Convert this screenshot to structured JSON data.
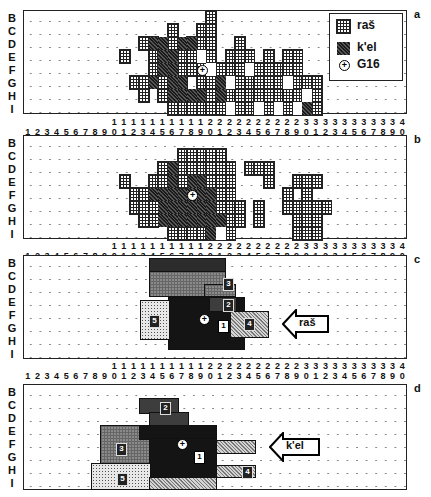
{
  "figure": {
    "row_labels": [
      "B",
      "C",
      "D",
      "E",
      "F",
      "G",
      "H",
      "I"
    ],
    "column_labels": [
      "1",
      "2",
      "3",
      "4",
      "5",
      "6",
      "7",
      "8",
      "9",
      "10",
      "11",
      "12",
      "13",
      "14",
      "15",
      "16",
      "17",
      "18",
      "19",
      "20",
      "21",
      "22",
      "23",
      "24",
      "25",
      "26",
      "27",
      "28",
      "29",
      "30",
      "31",
      "32",
      "33",
      "34",
      "35",
      "36",
      "37",
      "38",
      "39",
      "40"
    ],
    "panels": [
      {
        "letter": "a"
      },
      {
        "letter": "b"
      },
      {
        "letter": "c"
      },
      {
        "letter": "d"
      }
    ]
  },
  "legend": {
    "items": [
      {
        "label": "raš",
        "pattern": "crosshatch"
      },
      {
        "label": "k'el",
        "pattern": "diagonal-dark"
      },
      {
        "label": "G16",
        "symbol": "circled-plus"
      }
    ]
  },
  "panel_c": {
    "arrow_label": "raš",
    "zones": [
      {
        "id": "1"
      },
      {
        "id": "2"
      },
      {
        "id": "3"
      },
      {
        "id": "4"
      },
      {
        "id": "5"
      }
    ]
  },
  "panel_d": {
    "arrow_label": "k'el",
    "zones": [
      {
        "id": "1"
      },
      {
        "id": "2"
      },
      {
        "id": "3"
      },
      {
        "id": "4"
      },
      {
        "id": "5"
      }
    ]
  },
  "chart_data": {
    "type": "heatmap",
    "title": "",
    "xlabel": "Columns 1–40",
    "ylabel": "Rows B–I",
    "x": [
      "1",
      "2",
      "3",
      "4",
      "5",
      "6",
      "7",
      "8",
      "9",
      "10",
      "11",
      "12",
      "13",
      "14",
      "15",
      "16",
      "17",
      "18",
      "19",
      "20",
      "21",
      "22",
      "23",
      "24",
      "25",
      "26",
      "27",
      "28",
      "29",
      "30",
      "31",
      "32",
      "33",
      "34",
      "35",
      "36",
      "37",
      "38",
      "39",
      "40"
    ],
    "y": [
      "B",
      "C",
      "D",
      "E",
      "F",
      "G",
      "H",
      "I"
    ],
    "panels": [
      {
        "letter": "a",
        "legend": [
          "raš",
          "k'el",
          "G16"
        ],
        "ras_runs": [
          [
            "B",
            20,
            20
          ],
          [
            "C",
            19,
            20
          ],
          [
            "C",
            16,
            16
          ],
          [
            "D",
            13,
            14
          ],
          [
            "D",
            16,
            16
          ],
          [
            "D",
            18,
            20
          ],
          [
            "D",
            23,
            23
          ],
          [
            "E",
            11,
            11
          ],
          [
            "E",
            14,
            15
          ],
          [
            "E",
            17,
            18
          ],
          [
            "E",
            19,
            20
          ],
          [
            "E",
            22,
            24
          ],
          [
            "E",
            26,
            26
          ],
          [
            "E",
            28,
            29
          ],
          [
            "F",
            14,
            15
          ],
          [
            "F",
            17,
            17
          ],
          [
            "F",
            18,
            19
          ],
          [
            "F",
            21,
            29
          ],
          [
            "G",
            12,
            13
          ],
          [
            "G",
            15,
            15
          ],
          [
            "G",
            17,
            17
          ],
          [
            "G",
            19,
            20
          ],
          [
            "G",
            21,
            31
          ],
          [
            "H",
            13,
            13
          ],
          [
            "H",
            15,
            16
          ],
          [
            "H",
            20,
            20
          ],
          [
            "H",
            22,
            31
          ],
          [
            "I",
            16,
            31
          ]
        ],
        "kel_runs": [
          [
            "D",
            14,
            15
          ],
          [
            "D",
            17,
            18
          ],
          [
            "E",
            15,
            16
          ],
          [
            "F",
            15,
            16
          ],
          [
            "G",
            14,
            14
          ],
          [
            "G",
            16,
            17
          ],
          [
            "G",
            21,
            21
          ],
          [
            "G",
            28,
            28
          ],
          [
            "H",
            16,
            19
          ],
          [
            "H",
            21,
            21
          ],
          [
            "I",
            30,
            30
          ]
        ],
        "empty_in_ras": [
          [
            "E",
            19,
            19
          ],
          [
            "F",
            20,
            20
          ],
          [
            "F",
            24,
            24
          ],
          [
            "G",
            22,
            22
          ],
          [
            "G",
            28,
            28
          ],
          [
            "H",
            30,
            30
          ],
          [
            "I",
            22,
            22
          ],
          [
            "I",
            25,
            25
          ],
          [
            "I",
            27,
            27
          ],
          [
            "I",
            29,
            29
          ]
        ],
        "g16_cell": [
          "F",
          19
        ]
      },
      {
        "letter": "b",
        "legend": [
          "raš",
          "k'el",
          "G16"
        ],
        "description": "raš crosshatch cluster cols 13–33 rows C–I with k'el core cols 15–21 rows D–I; separate clusters at cols 23–26 and 28–31",
        "g16_cell": [
          "F",
          18
        ]
      },
      {
        "letter": "c",
        "arrow_label": "raš",
        "zones": [
          {
            "id": "1",
            "tone": "black",
            "cols": [
              15,
              22
            ],
            "rows": [
              "E",
              "H"
            ]
          },
          {
            "id": "2",
            "tone": "dark-gray",
            "cols": [
              19,
              21
            ],
            "rows": [
              "E",
              "E"
            ]
          },
          {
            "id": "3",
            "tone": "mid-gray crosshatch",
            "cols": [
              14,
              22
            ],
            "rows": [
              "C",
              "D"
            ]
          },
          {
            "id": "4",
            "tone": "light diagonal",
            "cols": [
              22,
              25
            ],
            "rows": [
              "F",
              "G"
            ]
          },
          {
            "id": "5",
            "tone": "dotted",
            "cols": [
              13,
              14
            ],
            "rows": [
              "E",
              "G"
            ]
          },
          {
            "id": "top",
            "tone": "dark",
            "cols": [
              14,
              21
            ],
            "rows": [
              "B",
              "B"
            ]
          }
        ],
        "g16_cell": [
          "F",
          17
        ]
      },
      {
        "letter": "d",
        "arrow_label": "k'el",
        "zones": [
          {
            "id": "1",
            "tone": "black",
            "cols": [
              14,
              21
            ],
            "rows": [
              "E",
              "H"
            ]
          },
          {
            "id": "2",
            "tone": "dark-gray",
            "cols": [
              14,
              17
            ],
            "rows": [
              "C",
              "D"
            ]
          },
          {
            "id": "3",
            "tone": "mid-gray crosshatch",
            "cols": [
              9,
              13
            ],
            "rows": [
              "E",
              "H"
            ]
          },
          {
            "id": "4",
            "tone": "light diagonal",
            "cols": [
              22,
              25
            ],
            "rows": [
              "F",
              "H"
            ]
          },
          {
            "id": "5",
            "tone": "dotted",
            "cols": [
              8,
              14
            ],
            "rows": [
              "H",
              "I"
            ]
          }
        ],
        "g16_cell": [
          "F",
          17
        ]
      }
    ]
  }
}
